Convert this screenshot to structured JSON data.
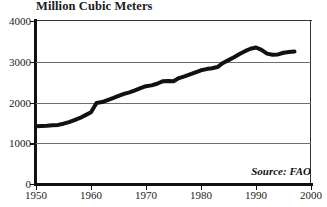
{
  "chart_data": {
    "type": "line",
    "title": "Million Cubic Meters",
    "xlabel": "",
    "ylabel": "Million Cubic Meters",
    "xlim": [
      1950,
      2000
    ],
    "ylim": [
      0,
      4000
    ],
    "xticks": [
      1950,
      1960,
      1970,
      1980,
      1990,
      2000
    ],
    "xtick_labels": [
      "1950",
      "1960",
      "1970",
      "1980",
      "1990",
      "2000"
    ],
    "yticks": [
      0,
      1000,
      2000,
      3000,
      4000
    ],
    "ytick_labels": [
      "0",
      "1000",
      "2000",
      "3000",
      "4000"
    ],
    "gridlines_y": [
      1000,
      2000,
      3000
    ],
    "grid": true,
    "legend": null,
    "annotations": [
      {
        "text": "Source: FAO",
        "position": "bottom-right",
        "style": "italic"
      }
    ],
    "series": [
      {
        "name": "World Roundwood Production",
        "color": "#111111",
        "line_width": 4,
        "x": [
          1950,
          1951,
          1952,
          1953,
          1954,
          1955,
          1956,
          1957,
          1958,
          1959,
          1960,
          1961,
          1962,
          1963,
          1964,
          1965,
          1966,
          1967,
          1968,
          1969,
          1970,
          1971,
          1972,
          1973,
          1974,
          1975,
          1976,
          1977,
          1978,
          1979,
          1980,
          1981,
          1982,
          1983,
          1984,
          1985,
          1986,
          1987,
          1988,
          1989,
          1990,
          1991,
          1992,
          1993,
          1994,
          1995,
          1996,
          1997
        ],
        "values": [
          1420,
          1425,
          1430,
          1440,
          1450,
          1480,
          1520,
          1570,
          1620,
          1690,
          1760,
          1990,
          2010,
          2060,
          2110,
          2160,
          2210,
          2250,
          2300,
          2350,
          2400,
          2420,
          2460,
          2520,
          2530,
          2520,
          2600,
          2640,
          2690,
          2740,
          2790,
          2820,
          2840,
          2870,
          2970,
          3040,
          3110,
          3190,
          3260,
          3320,
          3350,
          3290,
          3200,
          3170,
          3180,
          3220,
          3240,
          3250
        ]
      }
    ]
  },
  "axes": {
    "y": [
      {
        "label": "4000",
        "value": 4000
      },
      {
        "label": "3000",
        "value": 3000
      },
      {
        "label": "2000",
        "value": 2000
      },
      {
        "label": "1000",
        "value": 1000
      },
      {
        "label": "0",
        "value": 0
      }
    ],
    "x": [
      {
        "label": "1950",
        "value": 1950
      },
      {
        "label": "1960",
        "value": 1960
      },
      {
        "label": "1970",
        "value": 1970
      },
      {
        "label": "1980",
        "value": 1980
      },
      {
        "label": "1990",
        "value": 1990
      },
      {
        "label": "2000",
        "value": 2000
      }
    ]
  },
  "title": "Million Cubic Meters",
  "source": "Source: FAO"
}
